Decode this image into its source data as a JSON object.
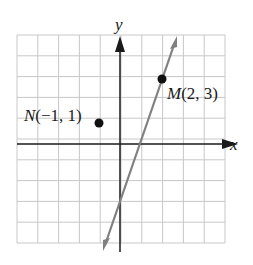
{
  "chart_data": {
    "type": "scatter",
    "title": "",
    "xlabel": "x",
    "ylabel": "y",
    "xlim": [
      -5,
      5
    ],
    "ylim": [
      -5,
      5
    ],
    "grid": true,
    "points": [
      {
        "name": "N",
        "x": -1,
        "y": 1,
        "label": "N(−1, 1)"
      },
      {
        "name": "M",
        "x": 2,
        "y": 3,
        "label": "M(2, 3)"
      }
    ],
    "lines": [
      {
        "description": "line through M(2,3) with slope 3",
        "slope": 3,
        "intercept": -3,
        "x_range": [
          -0.7,
          2.7
        ],
        "arrows": "both"
      }
    ]
  },
  "labels": {
    "x_axis": "x",
    "y_axis": "y",
    "point_n_letter": "N",
    "point_n_coords": "(−1, 1)",
    "point_m_letter": "M",
    "point_m_coords": "(2, 3)"
  },
  "colors": {
    "grid": "#c8c8c8",
    "axes": "#1a1a1a",
    "line": "#808080",
    "points": "#111111"
  }
}
